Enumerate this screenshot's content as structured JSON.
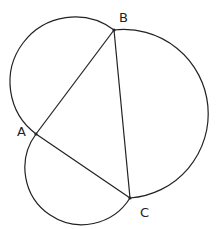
{
  "diagram": {
    "points": {
      "A": {
        "label": "A",
        "x": 36,
        "y": 134
      },
      "B": {
        "label": "B",
        "x": 114,
        "y": 30
      },
      "C": {
        "label": "C",
        "x": 130,
        "y": 198
      }
    },
    "segments": [
      "AB",
      "BC",
      "CA"
    ],
    "arcs": [
      "semicircle on AB (outer)",
      "semicircle on BC (outer)",
      "semicircle on CA (outer)"
    ],
    "stroke_color": "#222222"
  }
}
